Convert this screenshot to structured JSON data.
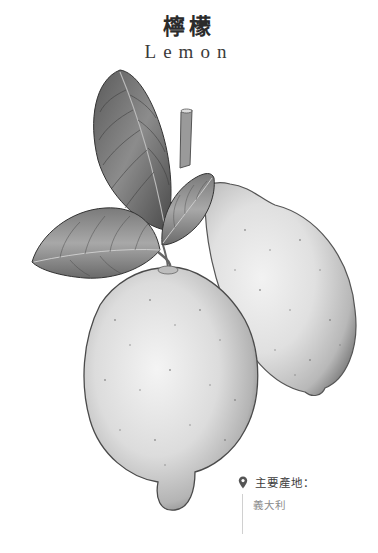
{
  "title": {
    "chinese": "檸檬",
    "english": "Lemon"
  },
  "illustration": {
    "subject": "lemon-fruit-with-leaves",
    "fruit_count": 2,
    "leaf_count": 4,
    "style": "grayscale botanical"
  },
  "origin": {
    "icon": "location-pin-icon",
    "label": "主要產地：",
    "value": "義大利"
  },
  "colors": {
    "title": "#2b2b2b",
    "label": "#3c3c3c",
    "value": "#8a8a8a",
    "divider": "#d0d0d0"
  }
}
